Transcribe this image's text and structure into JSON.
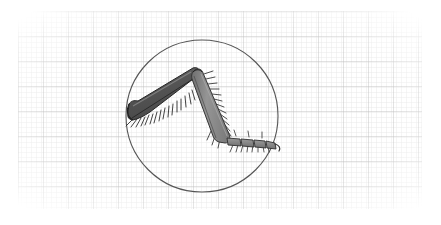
{
  "figure": {
    "kind": "scientific-specimen-illustration",
    "caption": "",
    "background_color": "#ffffff",
    "canvas": {
      "width": 441,
      "height": 225
    }
  },
  "graph_paper": {
    "name": "graph-paper-background",
    "minor_spacing_px": 5,
    "major_spacing_px": 25,
    "minor_color": "#e3e3e3",
    "major_color": "#bdbdbd",
    "area": {
      "x": 18,
      "y": 11,
      "width": 404,
      "height": 198
    },
    "fade_edges": true
  },
  "field_of_view": {
    "name": "microscope-field-circle",
    "shape": "circle",
    "center_x": 202,
    "center_y": 116,
    "radius": 76,
    "stroke_color": "#555555",
    "stroke_width": 1.1,
    "fill": "none"
  },
  "specimen": {
    "name": "insect-leg",
    "segments": [
      {
        "name": "femur",
        "label": "femur",
        "fill_color": "#585858",
        "outline_color": "#2b2b2b",
        "shading_color": "#747474",
        "proximal_x": 130,
        "proximal_y": 110,
        "distal_x": 196,
        "distal_y": 71,
        "spine_count": 16,
        "spine_edge": "ventral"
      },
      {
        "name": "tibia",
        "label": "tibia",
        "fill_color": "#8d8d8d",
        "outline_color": "#3a3a3a",
        "shading_color": "#6a6a6a",
        "proximal_x": 197,
        "proximal_y": 71,
        "distal_x": 228,
        "distal_y": 140,
        "spine_count": 15,
        "spine_edge": "outer"
      },
      {
        "name": "tarsus",
        "label": "tarsus",
        "fill_color": "#8a8a8a",
        "outline_color": "#333333",
        "subsegment_count": 4,
        "start_x": 229,
        "start_y": 141,
        "end_x": 275,
        "end_y": 146,
        "bristle_count": 10
      }
    ],
    "claw": {
      "name": "tarsal-claw",
      "tip_x": 277,
      "tip_y": 148,
      "color": "#2f2f2f"
    }
  }
}
